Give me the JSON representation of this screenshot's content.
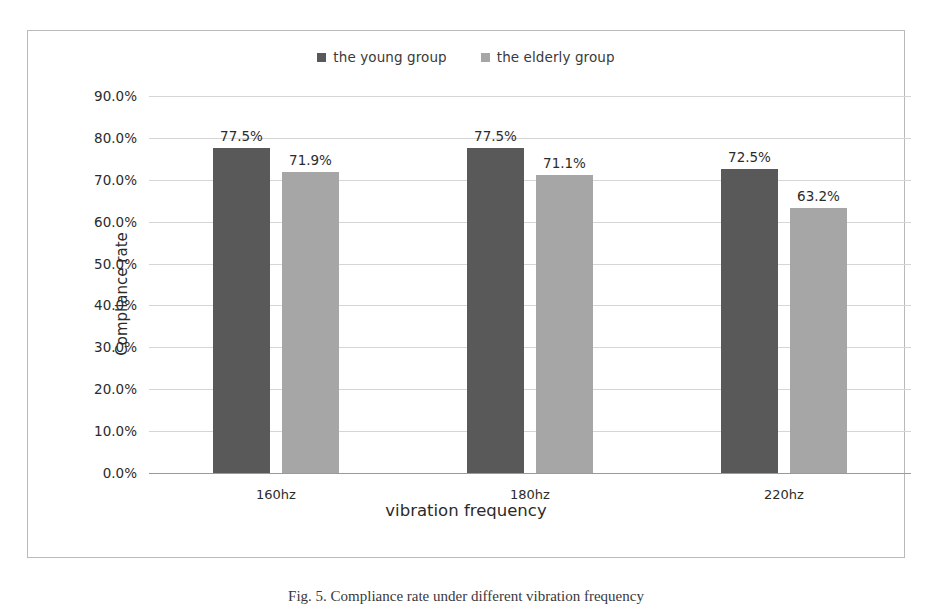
{
  "figure": {
    "caption": "Fig. 5.  Compliance rate under different vibration frequency"
  },
  "colors": {
    "young_group": "#595959",
    "elderly_group": "#a6a6a6",
    "gridline": "#d5d5d5",
    "axis": "#9a9a9a",
    "frame_border": "#b9b9b9",
    "text": "#2b2b2b"
  },
  "chart_data": {
    "type": "bar",
    "title": "",
    "xlabel": "vibration frequency",
    "ylabel": "Compliance rate",
    "categories": [
      "160hz",
      "180hz",
      "220hz"
    ],
    "series": [
      {
        "name": "the young group",
        "color": "#595959",
        "values": [
          77.5,
          77.5,
          72.5
        ],
        "labels": [
          "77.5%",
          "77.5%",
          "72.5%"
        ]
      },
      {
        "name": "the elderly group",
        "color": "#a6a6a6",
        "values": [
          71.9,
          71.1,
          63.2
        ],
        "labels": [
          "71.9%",
          "71.1%",
          "63.2%"
        ]
      }
    ],
    "ylim": [
      0,
      90
    ],
    "ytick_values": [
      90,
      80,
      70,
      60,
      50,
      40,
      30,
      20,
      10,
      0
    ],
    "ytick_labels": [
      "90.0%",
      "80.0%",
      "70.0%",
      "60.0%",
      "50.0%",
      "40.0%",
      "30.0%",
      "20.0%",
      "10.0%",
      "0.0%"
    ],
    "grid": true,
    "legend_position": "top-center",
    "value_labels_shown": true
  }
}
